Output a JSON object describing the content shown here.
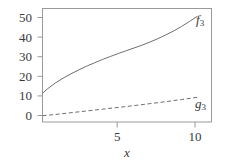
{
  "figure": {
    "background_color": "#ffffff",
    "line_color": "#6e6e6e",
    "frame_color": "#9a9a9a",
    "text_color": "#3a3a3a"
  },
  "chart_data": {
    "type": "line",
    "title": "",
    "subtitle": "",
    "xlabel": "x",
    "ylabel": "",
    "xlim": [
      0.2,
      10.9
    ],
    "ylim": [
      -2.5,
      55
    ],
    "grid": false,
    "legend_position": "inline-right-of-curve-end",
    "xticks": [
      5,
      10
    ],
    "xtick_labels": [
      "5",
      "10"
    ],
    "yticks": [
      0,
      10,
      20,
      30,
      40,
      50
    ],
    "ytick_labels": [
      "0",
      "10",
      "20",
      "30",
      "40",
      "50"
    ],
    "annotations": [
      {
        "text": "f",
        "subscript": "3",
        "x": 10.6,
        "y": 51
      },
      {
        "text": "g",
        "subscript": "3",
        "x": 10.6,
        "y": 10.5
      }
    ],
    "series": [
      {
        "name": "f3",
        "label": "f",
        "label_subscript": "3",
        "style": "solid",
        "color": "#6e6e6e",
        "x": [
          0.2,
          0.5,
          1,
          1.5,
          2,
          2.5,
          3,
          3.5,
          4,
          4.5,
          5,
          5.5,
          6,
          6.5,
          7,
          7.5,
          8,
          8.5,
          9,
          9.5,
          10
        ],
        "y": [
          12.0,
          14.2,
          17.2,
          19.7,
          21.9,
          23.9,
          25.8,
          27.5,
          29.2,
          30.7,
          32.2,
          33.6,
          35.0,
          36.4,
          38.0,
          39.7,
          41.6,
          43.6,
          45.9,
          48.4,
          51.0
        ]
      },
      {
        "name": "g3",
        "label": "g",
        "label_subscript": "3",
        "style": "dashed",
        "color": "#6e6e6e",
        "x": [
          0.2,
          1,
          2,
          3,
          4,
          5,
          6,
          7,
          8,
          9,
          10
        ],
        "y": [
          0.7,
          1.3,
          2.2,
          3.1,
          4.0,
          4.9,
          5.8,
          6.8,
          7.8,
          8.9,
          10.0
        ]
      }
    ]
  },
  "axes": {
    "y_tick_labels": [
      "50",
      "40",
      "30",
      "20",
      "10",
      "0"
    ],
    "x_tick_labels": [
      "5",
      "10"
    ],
    "x_axis_title": "x"
  }
}
